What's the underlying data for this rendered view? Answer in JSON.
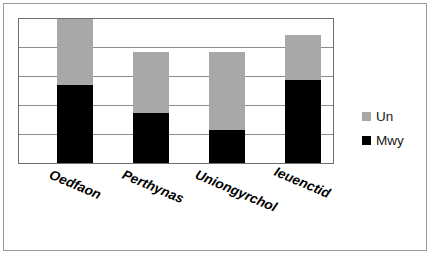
{
  "chart_data": {
    "type": "bar",
    "subtype": "stacked-column",
    "title": "",
    "xlabel": "",
    "ylabel": "",
    "categories": [
      "Oedfaon",
      "Perthynas",
      "Uniongyrchol",
      "Ieuenctid"
    ],
    "series": [
      {
        "name": "Mwy",
        "color": "#000000",
        "values": [
          2.7,
          1.75,
          1.13,
          2.87
        ]
      },
      {
        "name": "Un",
        "color": "#a8a8a8",
        "values": [
          2.3,
          2.12,
          2.74,
          1.58
        ]
      }
    ],
    "totals": [
      5.0,
      3.87,
      3.87,
      4.45
    ],
    "ylim": [
      0,
      5
    ],
    "yticks": [
      0,
      1,
      2,
      3,
      4,
      5
    ],
    "ytick_labels": [
      "",
      "",
      "",
      "",
      "",
      ""
    ],
    "grid": true,
    "grid_axis": "y",
    "legend": [
      "Un",
      "Mwy"
    ],
    "legend_position": "right"
  },
  "legend": {
    "items": [
      {
        "label": "Un",
        "color": "#a8a8a8"
      },
      {
        "label": "Mwy",
        "color": "#000000"
      }
    ]
  }
}
